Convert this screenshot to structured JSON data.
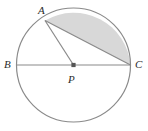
{
  "figure": {
    "type": "geometry-diagram",
    "width": 148,
    "height": 131,
    "background_color": "#ffffff"
  },
  "colors": {
    "stroke": "#8a8a8a",
    "chord_stroke": "#8a8a8a",
    "segment_fill": "#d8d8d8",
    "label_color": "#2b2b2b",
    "center_dot": "#555555"
  },
  "circle": {
    "center_x": 73.5,
    "center_y": 65,
    "radius": 57,
    "stroke_width": 1.2
  },
  "points": {
    "A": {
      "label": "A",
      "x": 45,
      "y": 20.5
    },
    "B": {
      "label": "B",
      "x": 16.5,
      "y": 65
    },
    "P": {
      "label": "P",
      "x": 73.5,
      "y": 65
    },
    "C": {
      "label": "C",
      "x": 130.5,
      "y": 65
    }
  },
  "segments": [
    {
      "name": "diameter-BC",
      "from": "B",
      "to": "C"
    },
    {
      "name": "radius-AP",
      "from": "A",
      "to": "P"
    },
    {
      "name": "chord-AC",
      "from": "A",
      "to": "C"
    }
  ],
  "shaded_region": {
    "name": "circular-segment-AC",
    "description": "region bounded by chord AC and minor arc AC",
    "fill": "#d8d8d8"
  }
}
